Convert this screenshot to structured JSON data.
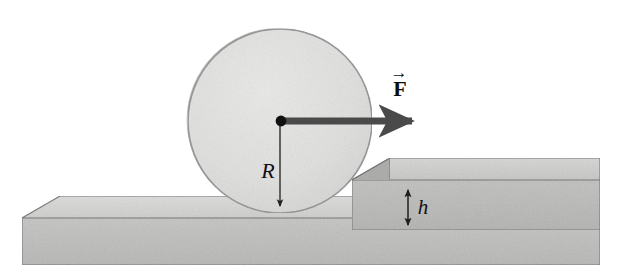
{
  "figure": {
    "type": "physics-free-body-diagram",
    "background_color": "#ffffff"
  },
  "labels": {
    "radius": "R",
    "force": "F",
    "force_accent": "→",
    "step_height": "h"
  },
  "colors": {
    "wheel_fill": "#dededd",
    "wheel_fill_light": "#e8e8e7",
    "wheel_stroke": "#8f8f8f",
    "slab_top_face": "#d3d3d2",
    "slab_front_face": "#bdbdbc",
    "step_top_face": "#cbcbca",
    "step_front_face": "#b8b8b7",
    "step_side_face": "#a9a9a8",
    "outline": "#6b6b6b",
    "arrow_force": "#4a4a4a",
    "arrow_thin": "#2b2b2b",
    "label_color": "#111111",
    "center_dot": "#111111"
  },
  "geometry": {
    "wheel": {
      "cx": 280,
      "cy": 121,
      "r": 92
    },
    "force_arrow": {
      "x1": 282,
      "y1": 121,
      "x2": 420,
      "y2": 121,
      "thickness": 7
    },
    "radius_arrow": {
      "x1": 280,
      "y1": 124,
      "x2": 280,
      "y2": 212
    },
    "height_arrow": {
      "x": 408,
      "y_top": 185,
      "y_bottom": 230
    },
    "base_slab": {
      "left": 22,
      "right": 600,
      "top_front": 218,
      "bottom": 265,
      "depth_offset_x": 38,
      "depth_offset_y": 22
    },
    "step_block": {
      "left": 352,
      "right": 600,
      "top_front": 180,
      "bottom": 230,
      "depth_offset_x": 38,
      "depth_offset_y": 22
    }
  },
  "label_positions": {
    "radius": {
      "x": 268,
      "y": 178
    },
    "force": {
      "x": 400,
      "y": 96
    },
    "force_accent": {
      "x": 399,
      "y": 78
    },
    "step_height": {
      "x": 423,
      "y": 214
    }
  }
}
